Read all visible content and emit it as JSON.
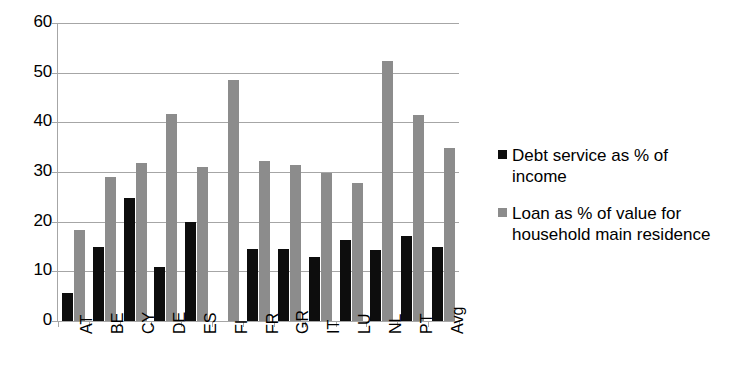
{
  "chart_data": {
    "type": "bar",
    "title": "",
    "subtitle": "",
    "xlabel": "",
    "ylabel": "",
    "ylim": [
      0,
      60
    ],
    "ytick_step": 10,
    "yticks": [
      60,
      50,
      40,
      30,
      20,
      10,
      0
    ],
    "grid": true,
    "legend_position": "right",
    "categories": [
      "AT",
      "BE",
      "CY",
      "DE",
      "ES",
      "FI",
      "FR",
      "GR",
      "IT",
      "LU",
      "NL",
      "PT",
      "Avg"
    ],
    "series": [
      {
        "name": "Debt service as % of income",
        "color": "#0d0d0d",
        "values": [
          5.6,
          15.0,
          24.8,
          10.8,
          20.0,
          null,
          14.5,
          14.5,
          12.9,
          16.4,
          14.3,
          17.2,
          15.0
        ]
      },
      {
        "name": "Loan as % of value for household main residence",
        "color": "#8c8c8c",
        "values": [
          18.4,
          28.9,
          31.9,
          41.7,
          31.0,
          48.5,
          32.2,
          31.4,
          29.9,
          27.7,
          52.3,
          41.4,
          34.9
        ]
      }
    ]
  },
  "legend": {
    "items": [
      {
        "label": "Debt service as % of income",
        "color": "#0d0d0d",
        "swatch": "legend-swatch-black"
      },
      {
        "label": "Loan as % of value for household main residence",
        "color": "#8c8c8c",
        "swatch": "legend-swatch-gray"
      }
    ]
  },
  "colors": {
    "series_black": "#0d0d0d",
    "series_gray": "#8c8c8c",
    "axis": "#a6a6a6",
    "background": "#ffffff",
    "text": "#000000"
  }
}
